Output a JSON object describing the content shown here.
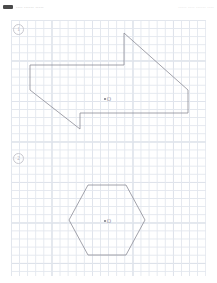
{
  "header": {
    "logo_icon": "app-logo-icon",
    "segments": [
      "••••  ••••••  •••••",
      "•••••  ••••  ••••••  ••••"
    ]
  },
  "worksheet": {
    "grid": {
      "minor_cell_px": 8.1,
      "major_cell_px": 40.5,
      "minor_color": "#e3e7ee",
      "major_color": "#ccd3de",
      "paper_color": "#ffffff"
    },
    "stroke_color": "#8c8c96",
    "sections": [
      {
        "number": "1",
        "badge_name": "section-badge-1",
        "figure_name": "arrow-banner-polygon",
        "center_point": {
          "label": "O",
          "dot_name": "center-dot-1"
        }
      },
      {
        "number": "2",
        "badge_name": "section-badge-2",
        "figure_name": "hexagon-polygon",
        "center_point": {
          "label": "O",
          "dot_name": "center-dot-2"
        }
      }
    ]
  },
  "chart_data": {
    "type": "line",
    "title": "",
    "xlabel": "",
    "ylabel": "",
    "grid": true,
    "figures": [
      {
        "name": "arrow-banner-polygon",
        "type": "polygon",
        "closed": true,
        "center": [
          107,
          84
        ],
        "points": [
          [
            30,
            51
          ],
          [
            124,
            51
          ],
          [
            124,
            19
          ],
          [
            188,
            76
          ],
          [
            188,
            99
          ],
          [
            80,
            99
          ],
          [
            80,
            115
          ],
          [
            30,
            76
          ]
        ]
      },
      {
        "name": "hexagon-polygon",
        "type": "polygon",
        "closed": true,
        "center": [
          107,
          206
        ],
        "points": [
          [
            69,
            206
          ],
          [
            88,
            171
          ],
          [
            126,
            171
          ],
          [
            145,
            206
          ],
          [
            126,
            241
          ],
          [
            88,
            241
          ]
        ]
      }
    ]
  }
}
